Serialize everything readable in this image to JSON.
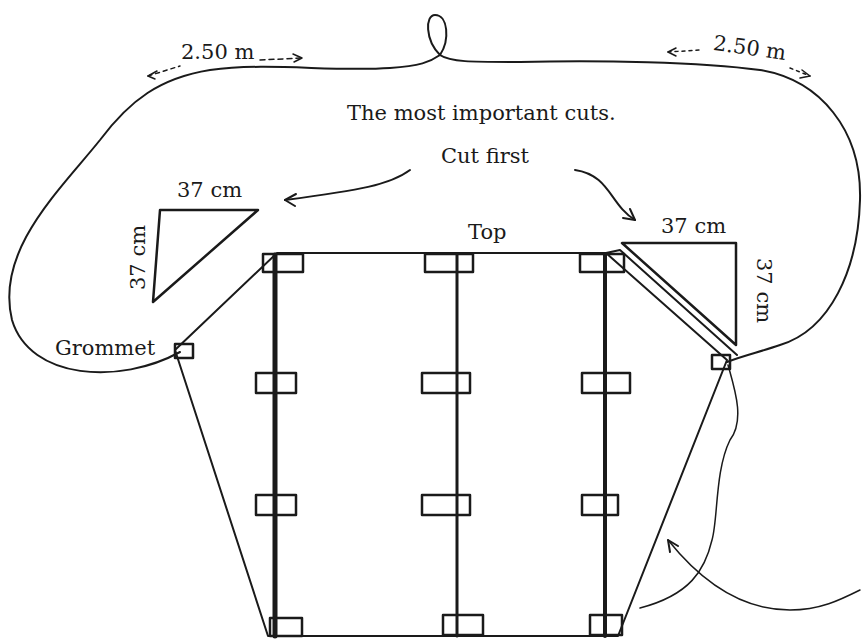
{
  "diagram": {
    "labels": {
      "bridle_left_length": "2.50 m",
      "bridle_right_length": "2.50 m",
      "note_line1": "The most important cuts.",
      "note_line2": "Cut first",
      "left_cut_top": "37 cm",
      "left_cut_side": "37 cm",
      "right_cut_top": "37 cm",
      "right_cut_side": "37 cm",
      "top": "Top",
      "grommet": "Grommet"
    },
    "colors": {
      "ink": "#1a1a1a",
      "background": "#ffffff"
    }
  }
}
